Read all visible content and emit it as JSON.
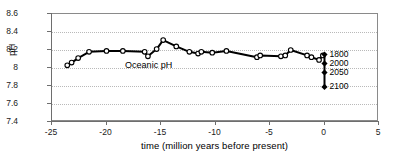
{
  "figure": {
    "y_axis_title": "pH",
    "x_axis_title": "time (million years before present)",
    "series_annotation": "Oceanic pH"
  },
  "chart_data": {
    "type": "line",
    "title": "",
    "xlabel": "time (million years before present)",
    "ylabel": "pH",
    "xlim": [
      -25,
      5
    ],
    "ylim": [
      7.4,
      8.6
    ],
    "xticks": [
      -25,
      -20,
      -15,
      -10,
      -5,
      0,
      5
    ],
    "xtick_labels": [
      "-25",
      "-20",
      "-15",
      "-10",
      "-5",
      "0",
      "5"
    ],
    "yticks": [
      7.4,
      7.6,
      7.8,
      8.0,
      8.2,
      8.4,
      8.6
    ],
    "ytick_labels": [
      "7.4",
      "7.6",
      "7.8",
      "8",
      "8.2",
      "8.4",
      "8.6"
    ],
    "grid": "horizontal-dotted",
    "legend": "none",
    "annotations": [
      {
        "text": "Oceanic pH",
        "x": -18.2,
        "y": 8.02
      }
    ],
    "series": [
      {
        "name": "Oceanic pH",
        "marker": "open-circle",
        "line_color": "#000000",
        "x": [
          -23.6,
          -23.2,
          -22.6,
          -21.6,
          -20.0,
          -18.5,
          -16.5,
          -16.2,
          -15.4,
          -14.8,
          -13.6,
          -12.4,
          -11.6,
          -11.3,
          -10.3,
          -9.0,
          -6.2,
          -5.9,
          -4.0,
          -3.6,
          -3.1,
          -1.6,
          -1.2,
          -0.5,
          -0.15
        ],
        "y": [
          8.03,
          8.06,
          8.11,
          8.18,
          8.19,
          8.19,
          8.18,
          8.13,
          8.21,
          8.31,
          8.24,
          8.18,
          8.16,
          8.18,
          8.17,
          8.19,
          8.12,
          8.14,
          8.13,
          8.14,
          8.2,
          8.14,
          8.12,
          8.09,
          8.14
        ]
      },
      {
        "name": "Projected future oceanic pH",
        "marker": "filled-diamond",
        "line_color": "#000000",
        "x": [
          0,
          0,
          0,
          0
        ],
        "y": [
          8.15,
          8.05,
          7.95,
          7.79
        ],
        "point_labels": [
          "1800",
          "2000",
          "2050",
          "2100"
        ]
      }
    ]
  },
  "scenario_labels": [
    {
      "label": "1800",
      "ph": 8.15
    },
    {
      "label": "2000",
      "ph": 8.05
    },
    {
      "label": "2050",
      "ph": 7.95
    },
    {
      "label": "2100",
      "ph": 7.79
    }
  ]
}
